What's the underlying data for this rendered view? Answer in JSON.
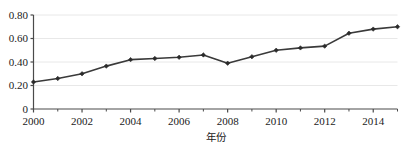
{
  "chart_data": {
    "type": "line",
    "title": "",
    "subtitle": "",
    "xlabel": "年份",
    "ylabel": "",
    "x": [
      2000,
      2001,
      2002,
      2003,
      2004,
      2005,
      2006,
      2007,
      2008,
      2009,
      2010,
      2011,
      2012,
      2013,
      2014,
      2015
    ],
    "values": [
      0.23,
      0.26,
      0.3,
      0.365,
      0.42,
      0.43,
      0.44,
      0.46,
      0.39,
      0.445,
      0.5,
      0.52,
      0.535,
      0.645,
      0.68,
      0.7
    ],
    "series": [
      {
        "name": "",
        "values": [
          0.23,
          0.26,
          0.3,
          0.365,
          0.42,
          0.43,
          0.44,
          0.46,
          0.39,
          0.445,
          0.5,
          0.52,
          0.535,
          0.645,
          0.68,
          0.7
        ]
      }
    ],
    "xlim": [
      2000,
      2015
    ],
    "ylim": [
      0,
      0.8
    ],
    "x_tick_labels": [
      "2000",
      "2002",
      "2004",
      "2006",
      "2008",
      "2010",
      "2012",
      "2014"
    ],
    "x_tick_values": [
      2000,
      2002,
      2004,
      2006,
      2008,
      2010,
      2012,
      2014
    ],
    "x_minor_tick_values": [
      2001,
      2003,
      2005,
      2007,
      2009,
      2011,
      2013,
      2015
    ],
    "y_tick_labels": [
      "0",
      "0.20",
      "0.40",
      "0.60",
      "0.80"
    ],
    "y_tick_values": [
      0,
      0.2,
      0.4,
      0.6,
      0.8
    ],
    "grid": {
      "horizontal": true,
      "vertical": false
    },
    "legend": {
      "visible": false,
      "position": "none"
    },
    "marker": "diamond",
    "colors": {
      "line": "#3a3a3a",
      "marker": "#2b2b2b",
      "axis": "#4a4a4a",
      "grid": "#e8e8e8",
      "background": "#ffffff",
      "text": "#1a1a1a"
    }
  },
  "axis_titles": {
    "x": "年份"
  }
}
